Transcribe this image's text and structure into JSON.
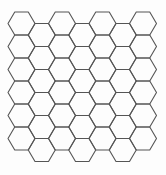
{
  "diagram": {
    "type": "hexagonal-grid",
    "orientation": "flat-top",
    "columns": 7,
    "hexes_per_column": 6,
    "odd_column_offset": "down-half",
    "side_length": 13.5,
    "row_step": 23,
    "column_step": 20.25,
    "origin_center": [
      21.5,
      23.5
    ],
    "stroke_color": "#555555",
    "background_color": "#fdfdfd",
    "fill": "none"
  }
}
